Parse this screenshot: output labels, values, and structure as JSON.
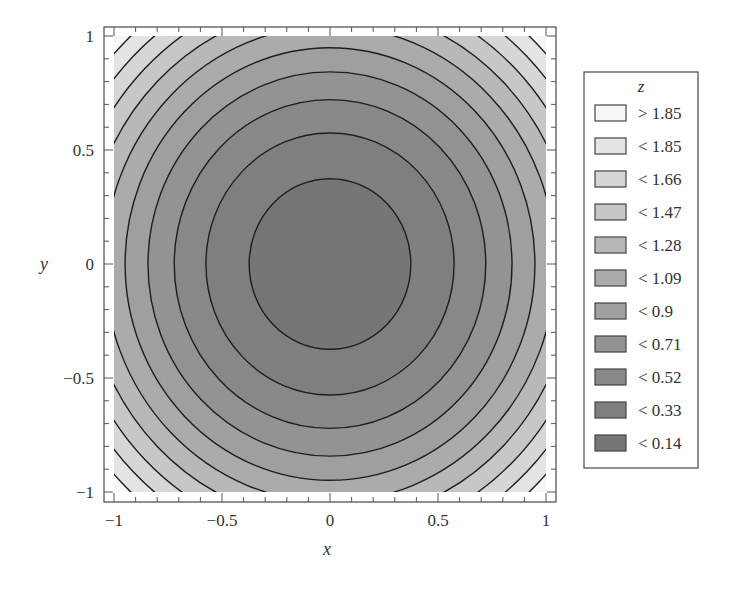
{
  "chart_data": {
    "type": "contour",
    "function": "z = x^2 + y^2",
    "title": "",
    "xlabel": "x",
    "ylabel": "y",
    "xlim": [
      -1,
      1
    ],
    "ylim": [
      -1,
      1
    ],
    "x_ticks": [
      -1,
      -0.5,
      0,
      0.5,
      1
    ],
    "x_tick_labels": [
      "−1",
      "−0.5",
      "0",
      "0.5",
      "1"
    ],
    "y_ticks": [
      -1,
      -0.5,
      0,
      0.5,
      1
    ],
    "y_tick_labels": [
      "−1",
      "−0.5",
      "0",
      "0.5",
      "1"
    ],
    "minor_tick_step": 0.1,
    "grid": false,
    "contour_levels": [
      0.14,
      0.33,
      0.52,
      0.71,
      0.9,
      1.09,
      1.28,
      1.47,
      1.66,
      1.85
    ],
    "legend": {
      "position": "right",
      "title": "z",
      "entries": [
        {
          "label": "> 1.85",
          "color": "#f6f6f6"
        },
        {
          "label": "< 1.85",
          "color": "#e4e4e4"
        },
        {
          "label": "< 1.66",
          "color": "#d6d6d6"
        },
        {
          "label": "< 1.47",
          "color": "#c7c7c7"
        },
        {
          "label": "< 1.28",
          "color": "#b8b8b8"
        },
        {
          "label": "< 1.09",
          "color": "#ababab"
        },
        {
          "label": "< 0.9",
          "color": "#9f9f9f"
        },
        {
          "label": "< 0.71",
          "color": "#939393"
        },
        {
          "label": "< 0.52",
          "color": "#888888"
        },
        {
          "label": "< 0.33",
          "color": "#7f7f7f"
        },
        {
          "label": "< 0.14",
          "color": "#767676"
        }
      ]
    }
  }
}
